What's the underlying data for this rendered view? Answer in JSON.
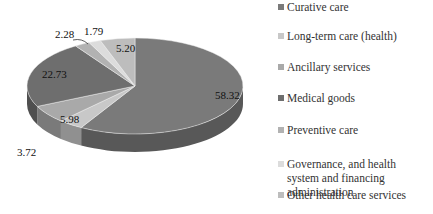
{
  "chart_data": {
    "type": "pie",
    "style": "3d",
    "title": "",
    "categories": [
      "Curative care",
      "Long-term care (health)",
      "Ancillary services",
      "Medical goods",
      "Preventive care",
      "Governance, and health system and financing administration",
      "Other health care services"
    ],
    "values": [
      58.32,
      3.72,
      5.98,
      22.73,
      2.28,
      1.79,
      5.2
    ],
    "labels": [
      "58.32",
      "3.72",
      "5.98",
      "22.73",
      "2.28",
      "1.79",
      "5.20"
    ],
    "colors": [
      "#7a7a7a",
      "#c8c8c8",
      "#a9a9a9",
      "#6e6e6e",
      "#b2b2b2",
      "#dcdcdc",
      "#bdbdbd"
    ],
    "legend_position": "right"
  },
  "legend": {
    "items": [
      {
        "label": "Curative care",
        "color": "#7a7a7a"
      },
      {
        "label": "Long-term care (health)",
        "color": "#c8c8c8"
      },
      {
        "label": "Ancillary services",
        "color": "#a9a9a9"
      },
      {
        "label": "Medical goods",
        "color": "#6e6e6e"
      },
      {
        "label": "Preventive care",
        "color": "#b2b2b2"
      },
      {
        "label": "Governance, and health system and financing administration",
        "color": "#dcdcdc"
      },
      {
        "label": "Other health care services",
        "color": "#bdbdbd"
      }
    ]
  },
  "data_labels": {
    "curative": "58.32",
    "longterm": "3.72",
    "ancillary": "5.98",
    "medical": "22.73",
    "preventive": "2.28",
    "governance": "1.79",
    "other": "5.20"
  }
}
